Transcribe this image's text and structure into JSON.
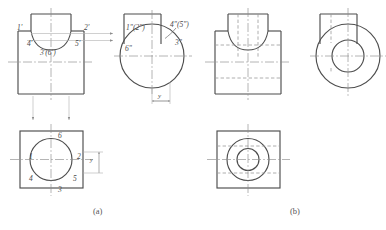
{
  "figure": {
    "title_caption_a": "(a)",
    "title_caption_b": "(b)",
    "colors": {
      "visible_outline": "#4d4d4d",
      "hidden_line": "#9a9a9a",
      "center_line": "#8c8c8c",
      "projection_line": "#b0b0b0",
      "text": "#4a4a4a",
      "background": "#ffffff"
    }
  },
  "part_a": {
    "front_view": {
      "name": "front-view-labelled",
      "point_labels": [
        {
          "id": "p1f",
          "text": "1'",
          "x": 17,
          "y": 25
        },
        {
          "id": "p2f",
          "text": "2'",
          "x": 84,
          "y": 25
        },
        {
          "id": "p4f",
          "text": "4'",
          "x": 27,
          "y": 41
        },
        {
          "id": "p5f",
          "text": "5'",
          "x": 75,
          "y": 41
        },
        {
          "id": "p36f",
          "text": "3'(6')",
          "x": 42,
          "y": 50
        }
      ]
    },
    "side_view": {
      "name": "side-view-labelled",
      "point_labels": [
        {
          "id": "p12s",
          "text": "1\"(2\")",
          "x": 128,
          "y": 25
        },
        {
          "id": "p45s",
          "text": "4\"(5\")",
          "x": 170,
          "y": 23
        },
        {
          "id": "p3s",
          "text": "3\"",
          "x": 175,
          "y": 42
        },
        {
          "id": "p6s",
          "text": "6\"",
          "x": 126,
          "y": 48
        }
      ],
      "dimension_label": "y"
    },
    "top_view": {
      "name": "top-view-labelled",
      "point_labels": [
        {
          "id": "p6t",
          "text": "6",
          "x": 59,
          "y": 133
        },
        {
          "id": "p1t",
          "text": "1",
          "x": 31,
          "y": 155
        },
        {
          "id": "p2t",
          "text": "2",
          "x": 78,
          "y": 155
        },
        {
          "id": "p4t",
          "text": "4",
          "x": 31,
          "y": 177
        },
        {
          "id": "p5t",
          "text": "5",
          "x": 74,
          "y": 177
        },
        {
          "id": "p3t",
          "text": "3",
          "x": 59,
          "y": 189
        }
      ],
      "dimension_label": "y"
    }
  },
  "part_b": {
    "front_view": {
      "name": "front-view-complete"
    },
    "side_view": {
      "name": "side-view-complete"
    },
    "top_view": {
      "name": "top-view-complete"
    }
  }
}
